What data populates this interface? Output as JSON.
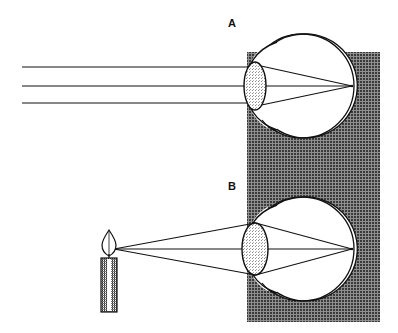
{
  "figure": {
    "width": 398,
    "height": 333,
    "background_color": "#ffffff",
    "ink_color": "#111111"
  },
  "panels": [
    {
      "id": "panel-a",
      "label": "A",
      "label_position": {
        "x": 228,
        "y": 27
      },
      "caption_role": "distant-object-parallel-rays",
      "eye": {
        "name": "eyeball",
        "center": {
          "x": 302,
          "y": 86
        },
        "radius": 52,
        "cornea_apex_x": 246,
        "lens": {
          "name": "lens",
          "center": {
            "x": 255,
            "y": 86
          },
          "rx": 11,
          "ry": 24,
          "fill": "#d9d9d9"
        },
        "focal_point": {
          "x": 352,
          "y": 86
        }
      },
      "rays": {
        "type": "parallel",
        "count": 3,
        "start_x": 22,
        "ray_y_values": [
          67,
          86,
          103
        ],
        "entry_x": 247
      }
    },
    {
      "id": "panel-b",
      "label": "B",
      "label_position": {
        "x": 228,
        "y": 190
      },
      "caption_role": "near-object-diverging-rays",
      "eye": {
        "name": "eyeball",
        "center": {
          "x": 302,
          "y": 249
        },
        "radius": 52,
        "cornea_apex_x": 246,
        "lens": {
          "name": "lens",
          "center": {
            "x": 255,
            "y": 249
          },
          "rx": 13,
          "ry": 26,
          "fill": "#d9d9d9"
        },
        "focal_point": {
          "x": 352,
          "y": 249
        }
      },
      "rays": {
        "type": "diverging-from-point",
        "count": 3,
        "source_point": {
          "x": 112,
          "y": 249
        },
        "entry_x": 247,
        "spread_y_values": [
          228,
          249,
          270
        ]
      },
      "object": {
        "name": "candle",
        "flame": {
          "x": 109,
          "y": 232,
          "width": 12,
          "height": 24
        },
        "body": {
          "x": 101,
          "y": 258,
          "width": 16,
          "height": 54
        },
        "wick": {
          "x": 109,
          "y": 254,
          "height": 6
        },
        "hatch_color": "#333333",
        "highlight_color": "#ffffff"
      }
    }
  ],
  "screen": {
    "name": "hatched-backdrop",
    "x": 247,
    "y": 52,
    "width": 133,
    "height": 270,
    "fill_color": "#3b3b3b",
    "pattern": "fine-cross-hatch"
  },
  "legend": {
    "panel_a_text": "A",
    "panel_b_text": "B"
  }
}
